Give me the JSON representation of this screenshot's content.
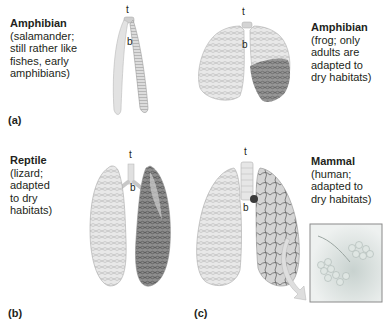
{
  "figure": {
    "panels": [
      {
        "id": "a",
        "label": "(a)",
        "captions": [
          {
            "title": "Amphibian",
            "desc_lines": [
              "(salamander;",
              "still rather like",
              "fishes, early",
              "amphibians)"
            ]
          },
          {
            "title": "Amphibian",
            "desc_lines": [
              "(frog; only",
              "adults are",
              "adapted to",
              "dry habitats)"
            ]
          }
        ]
      },
      {
        "id": "b",
        "label": "(b)",
        "captions": [
          {
            "title": "Reptile",
            "desc_lines": [
              "(lizard;",
              "adapted",
              "to dry",
              "habitats)"
            ]
          }
        ]
      },
      {
        "id": "c",
        "label": "(c)",
        "captions": [
          {
            "title": "Mammal",
            "desc_lines": [
              "(human;",
              "adapted to",
              "dry habitats)"
            ]
          }
        ]
      }
    ],
    "structure_tags": {
      "trachea": "t",
      "bronchus": "b"
    },
    "colors": {
      "lung_light": "#e6e6e6",
      "lung_mid": "#c8c8c8",
      "lung_dark": "#5a5a5a",
      "inset_border": "#8a8a8a",
      "arrow": "#d9d9d9"
    }
  }
}
